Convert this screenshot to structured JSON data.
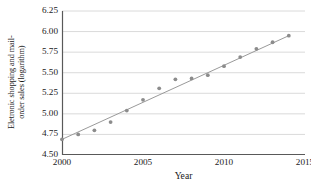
{
  "chart_data": {
    "type": "scatter",
    "title": "",
    "xlabel": "Year",
    "ylabel": "Eletronic shopping and mail-order sales (logarithm)",
    "ylabel_lines": [
      "Eletronic shopping and mail-",
      "order sales (logarithm)"
    ],
    "xlim": [
      2000,
      2015
    ],
    "ylim": [
      4.5,
      6.25
    ],
    "xticks": [
      2000,
      2005,
      2010,
      2015
    ],
    "xtick_labels": [
      "2000",
      "2005",
      "2010",
      "2015"
    ],
    "yticks": [
      4.5,
      4.75,
      5.0,
      5.25,
      5.5,
      5.75,
      6.0,
      6.25
    ],
    "ytick_labels": [
      "4.50",
      "4.75",
      "5.00",
      "5.25",
      "5.50",
      "5.75",
      "6.00",
      "6.25"
    ],
    "grid": "horizontal",
    "legend": "none",
    "x": [
      2000,
      2001,
      2002,
      2003,
      2004,
      2005,
      2006,
      2007,
      2008,
      2009,
      2010,
      2011,
      2012,
      2013,
      2014
    ],
    "values": [
      4.69,
      4.75,
      4.8,
      4.9,
      5.04,
      5.17,
      5.31,
      5.42,
      5.43,
      5.47,
      5.58,
      5.69,
      5.79,
      5.87,
      5.95
    ],
    "series": [
      {
        "name": "Eletronic shopping and mail-order sales (logarithm)",
        "type": "scatter",
        "marker": "circle",
        "marker_color": "#8c8c8c",
        "values": [
          4.69,
          4.75,
          4.8,
          4.9,
          5.04,
          5.17,
          5.31,
          5.42,
          5.43,
          5.47,
          5.58,
          5.69,
          5.79,
          5.87,
          5.95
        ]
      },
      {
        "name": "trend line",
        "type": "line",
        "line_color": "#9a9a9a",
        "endpoints_x": [
          2000,
          2014
        ],
        "endpoints_y": [
          4.69,
          5.95
        ]
      }
    ],
    "colors": {
      "marker": "#8c8c8c",
      "trendline": "#9a9a9a",
      "gridline": "#d0d0d0",
      "axis": "#595959",
      "background": "#ffffff",
      "text": "#1a1a1a"
    }
  }
}
